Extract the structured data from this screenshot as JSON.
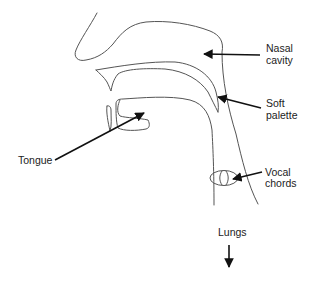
{
  "diagram": {
    "labels": {
      "nasal_cavity": [
        "Nasal",
        "cavity"
      ],
      "soft_palette": [
        "Soft",
        "palette"
      ],
      "tongue": [
        "Tongue"
      ],
      "vocal_chords": [
        "Vocal",
        "chords"
      ],
      "lungs": [
        "Lungs"
      ]
    },
    "colors": {
      "outline": "#555555",
      "arrow": "#111111",
      "text": "#222222",
      "background": "#ffffff"
    }
  }
}
